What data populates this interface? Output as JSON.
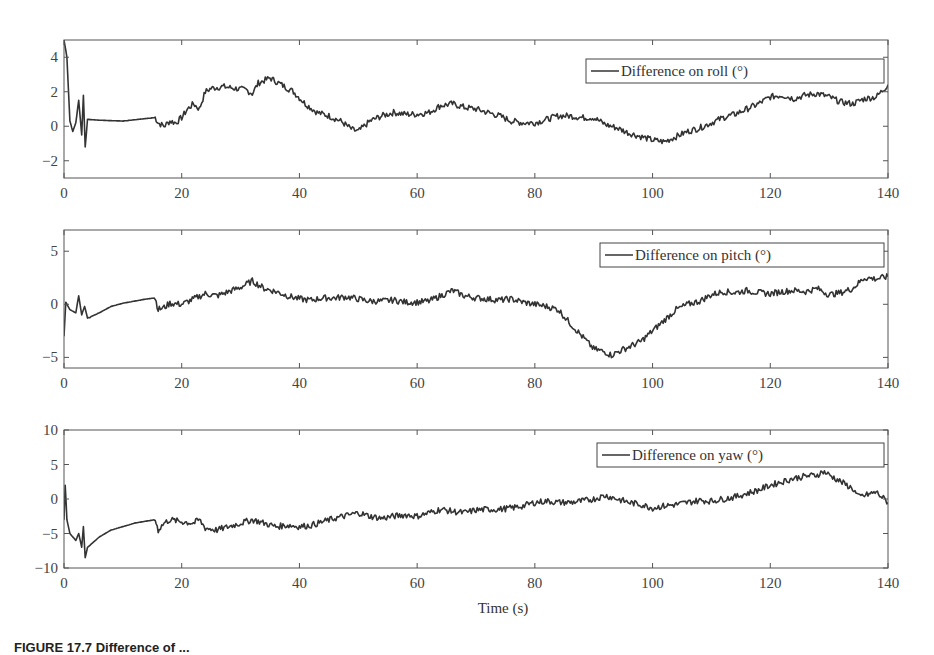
{
  "figure": {
    "xlabel": "Time (s)",
    "caption": "FIGURE 17.7   Difference of ..."
  },
  "chart_data": [
    {
      "type": "line",
      "title": "",
      "legend": "Difference on roll (°)",
      "legend_position": "upper right",
      "xlabel": "",
      "ylabel": "",
      "xlim": [
        0,
        140
      ],
      "ylim": [
        -3,
        5
      ],
      "xticks": [
        0,
        20,
        40,
        60,
        80,
        100,
        120,
        140
      ],
      "yticks": [
        -2,
        0,
        2,
        4
      ],
      "ytick_labels": [
        "−2",
        "0",
        "2",
        "4"
      ],
      "grid": false,
      "series": [
        {
          "name": "Difference on roll (°)",
          "x": [
            0,
            0.5,
            1,
            1.5,
            2,
            2.5,
            3,
            3.3,
            3.6,
            4,
            6,
            10,
            14,
            15.5,
            16,
            17,
            18,
            19,
            20,
            21,
            22,
            23,
            24,
            25,
            27,
            29,
            31,
            32,
            33,
            35,
            37,
            39,
            41,
            43,
            45,
            47,
            49,
            50,
            52,
            54,
            56,
            58,
            60,
            62,
            64,
            66,
            68,
            70,
            72,
            74,
            76,
            78,
            80,
            82,
            84,
            86,
            88,
            90,
            92,
            94,
            96,
            98,
            100,
            102,
            104,
            106,
            108,
            110,
            112,
            114,
            116,
            118,
            120,
            122,
            124,
            126,
            128,
            130,
            132,
            134,
            136,
            138,
            140
          ],
          "y": [
            5,
            4,
            0.3,
            -0.3,
            0.2,
            1.5,
            -0.5,
            1.8,
            -1.2,
            0.4,
            0.35,
            0.3,
            0.45,
            0.5,
            0.2,
            0.0,
            0.3,
            0.2,
            0.5,
            1.0,
            1.3,
            1.0,
            2.0,
            2.2,
            2.3,
            2.2,
            2.1,
            1.9,
            2.5,
            2.8,
            2.4,
            2.0,
            1.3,
            0.8,
            0.6,
            0.3,
            -0.2,
            -0.3,
            0.3,
            0.6,
            0.8,
            0.7,
            0.7,
            0.8,
            1.2,
            1.3,
            1.1,
            1.0,
            0.8,
            0.6,
            0.3,
            0.2,
            0.2,
            0.4,
            0.6,
            0.6,
            0.5,
            0.5,
            0.1,
            -0.1,
            -0.4,
            -0.6,
            -0.8,
            -0.9,
            -0.6,
            -0.3,
            -0.1,
            0.2,
            0.5,
            0.7,
            1.0,
            1.3,
            1.7,
            1.8,
            1.6,
            1.8,
            1.9,
            1.7,
            1.4,
            1.3,
            1.6,
            1.7,
            2.4
          ]
        }
      ]
    },
    {
      "type": "line",
      "title": "",
      "legend": "Difference on pitch (°)",
      "legend_position": "upper right",
      "xlabel": "",
      "ylabel": "",
      "xlim": [
        0,
        140
      ],
      "ylim": [
        -6,
        7
      ],
      "xticks": [
        0,
        20,
        40,
        60,
        80,
        100,
        120,
        140
      ],
      "yticks": [
        -5,
        0,
        5
      ],
      "ytick_labels": [
        "−5",
        "0",
        "5"
      ],
      "grid": false,
      "series": [
        {
          "name": "Difference on pitch (°)",
          "x": [
            0,
            0.3,
            1,
            2,
            2.5,
            3,
            3.5,
            4,
            6,
            8,
            10,
            12,
            14,
            15.5,
            16,
            17,
            18,
            20,
            22,
            24,
            26,
            28,
            30,
            32,
            34,
            36,
            38,
            40,
            42,
            44,
            46,
            48,
            50,
            52,
            54,
            56,
            58,
            60,
            62,
            64,
            66,
            68,
            70,
            72,
            74,
            76,
            78,
            80,
            82,
            84,
            86,
            88,
            90,
            92,
            93,
            94,
            96,
            98,
            100,
            102,
            104,
            106,
            108,
            110,
            112,
            114,
            116,
            118,
            120,
            122,
            124,
            126,
            128,
            130,
            132,
            134,
            136,
            138,
            140
          ],
          "y": [
            -3,
            0.2,
            -0.5,
            -0.8,
            0.8,
            -1.0,
            -0.2,
            -1.3,
            -0.8,
            -0.2,
            0.1,
            0.3,
            0.5,
            0.6,
            -0.5,
            -0.3,
            0.1,
            0.0,
            0.5,
            1.0,
            0.8,
            1.2,
            1.6,
            2.2,
            1.5,
            1.2,
            0.8,
            0.5,
            0.4,
            0.6,
            0.6,
            0.7,
            0.5,
            0.3,
            0.3,
            0.4,
            0.2,
            0.2,
            0.3,
            0.8,
            1.3,
            0.8,
            0.6,
            0.5,
            0.4,
            0.5,
            0.2,
            0.0,
            -0.2,
            -0.5,
            -1.8,
            -3.0,
            -4.2,
            -4.5,
            -4.8,
            -4.5,
            -4.0,
            -3.5,
            -2.5,
            -1.5,
            -0.5,
            0.0,
            0.3,
            0.9,
            1.2,
            1.1,
            1.3,
            1.1,
            1.0,
            1.2,
            1.3,
            1.2,
            1.5,
            0.9,
            1.1,
            1.5,
            2.5,
            2.4,
            2.6
          ]
        }
      ]
    },
    {
      "type": "line",
      "title": "",
      "legend": "Difference on yaw (°)",
      "legend_position": "upper right",
      "xlabel": "Time (s)",
      "ylabel": "",
      "xlim": [
        0,
        140
      ],
      "ylim": [
        -10,
        10
      ],
      "xticks": [
        0,
        20,
        40,
        60,
        80,
        100,
        120,
        140
      ],
      "yticks": [
        -10,
        -5,
        0,
        5,
        10
      ],
      "ytick_labels": [
        "−10",
        "−5",
        "0",
        "5",
        "10"
      ],
      "grid": false,
      "series": [
        {
          "name": "Difference on yaw (°)",
          "x": [
            0,
            0.2,
            0.5,
            1,
            2,
            2.5,
            3,
            3.3,
            3.6,
            4,
            6,
            8,
            10,
            12,
            14,
            15.5,
            16,
            17,
            18,
            20,
            22,
            23,
            24,
            26,
            28,
            30,
            32,
            34,
            36,
            38,
            40,
            42,
            44,
            46,
            48,
            50,
            52,
            54,
            56,
            58,
            60,
            62,
            64,
            66,
            68,
            70,
            72,
            74,
            76,
            78,
            80,
            82,
            84,
            86,
            88,
            90,
            92,
            94,
            96,
            98,
            100,
            102,
            104,
            106,
            108,
            110,
            112,
            114,
            116,
            118,
            120,
            122,
            124,
            126,
            128,
            129,
            130,
            132,
            134,
            135,
            136,
            138,
            140
          ],
          "y": [
            -3,
            2,
            -3,
            -5,
            -6,
            -5,
            -7,
            -4,
            -8.5,
            -7,
            -5.5,
            -4.5,
            -4,
            -3.5,
            -3.2,
            -3.0,
            -4.5,
            -3.5,
            -3.0,
            -3.3,
            -3.5,
            -3.0,
            -4.2,
            -4.5,
            -4.0,
            -3.5,
            -3.0,
            -3.5,
            -4.0,
            -3.8,
            -4.0,
            -3.8,
            -3.3,
            -2.8,
            -2.4,
            -2.0,
            -2.5,
            -2.8,
            -2.5,
            -2.3,
            -2.5,
            -2.0,
            -1.5,
            -1.8,
            -2.0,
            -1.6,
            -1.5,
            -1.5,
            -1.3,
            -1.0,
            -0.5,
            -0.3,
            -0.5,
            -0.5,
            -0.3,
            0.0,
            0.5,
            0.0,
            -0.5,
            -0.8,
            -1.3,
            -1.0,
            -0.8,
            -0.5,
            -0.2,
            -0.3,
            0.0,
            0.3,
            0.8,
            1.3,
            2.0,
            2.5,
            3.0,
            3.3,
            3.5,
            4.0,
            3.5,
            2.5,
            1.5,
            0.3,
            0.5,
            1.0,
            -0.5
          ]
        }
      ]
    }
  ],
  "layout": {
    "plot_left": 64,
    "plot_right": 888,
    "panels": [
      {
        "top": 40,
        "bottom": 178,
        "legend_box": [
          586,
          59,
          298,
          24
        ]
      },
      {
        "top": 230,
        "bottom": 368,
        "legend_box": [
          600,
          243,
          284,
          24
        ]
      },
      {
        "top": 430,
        "bottom": 568,
        "legend_box": [
          597,
          443,
          287,
          24
        ]
      }
    ],
    "line_color": "#333333",
    "axis_color": "#555555"
  }
}
